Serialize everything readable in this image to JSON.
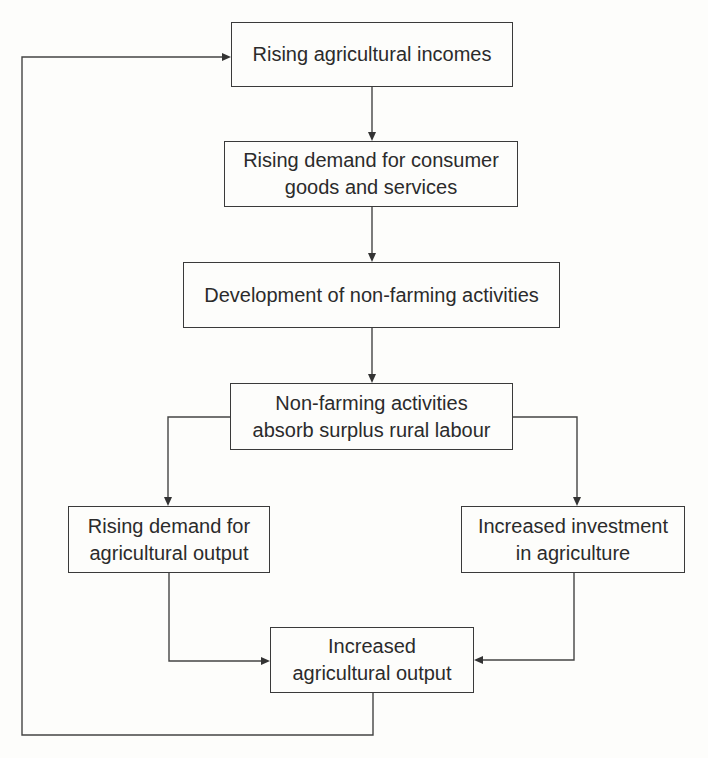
{
  "diagram": {
    "type": "flowchart",
    "nodes": [
      {
        "id": "n1",
        "label": "Rising agricultural incomes"
      },
      {
        "id": "n2",
        "label": "Rising demand for consumer\ngoods and services"
      },
      {
        "id": "n3",
        "label": "Development of non-farming activities"
      },
      {
        "id": "n4",
        "label": "Non-farming activities\nabsorb surplus rural labour"
      },
      {
        "id": "n5",
        "label": "Rising demand for\nagricultural output"
      },
      {
        "id": "n6",
        "label": "Increased investment\nin agriculture"
      },
      {
        "id": "n7",
        "label": "Increased\nagricultural output"
      }
    ],
    "edges": [
      {
        "from": "n1",
        "to": "n2"
      },
      {
        "from": "n2",
        "to": "n3"
      },
      {
        "from": "n3",
        "to": "n4"
      },
      {
        "from": "n4",
        "to": "n5"
      },
      {
        "from": "n4",
        "to": "n6"
      },
      {
        "from": "n5",
        "to": "n7"
      },
      {
        "from": "n6",
        "to": "n7"
      },
      {
        "from": "n7",
        "to": "n1",
        "kind": "feedback-loop"
      }
    ]
  }
}
